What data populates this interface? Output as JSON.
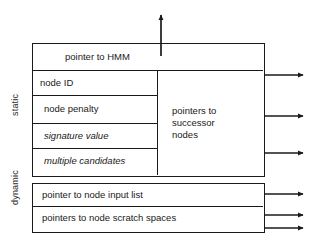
{
  "diagram": {
    "side_labels": {
      "static": "static",
      "dynamic": "dynamic"
    },
    "static_section": {
      "header_row": "pointer to HMM",
      "fields": [
        {
          "label": "node ID",
          "style": "normal"
        },
        {
          "label": "node penalty",
          "style": "normal"
        },
        {
          "label": "signature value",
          "style": "italic"
        },
        {
          "label": "multiple candidates",
          "style": "italic"
        }
      ],
      "successor_column": "pointers to\nsuccessor\nnodes",
      "successor_column_lines": [
        "pointers to",
        "successor",
        "nodes"
      ]
    },
    "dynamic_section": {
      "fields": [
        {
          "label": "pointer to node input list"
        },
        {
          "label": "pointers to node scratch spaces"
        }
      ]
    },
    "arrows": {
      "up_from_hmm": 1,
      "right_from_successors": 3,
      "right_from_input_list": 1,
      "right_from_scratch_spaces": 2,
      "total": 7
    },
    "colors": {
      "stroke": "#1a1a1a",
      "background": "#ffffff",
      "text": "#1a1a1a"
    }
  }
}
